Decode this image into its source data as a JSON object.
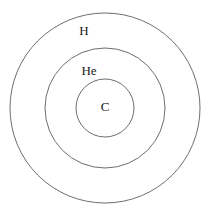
{
  "diagram": {
    "background_color": "#ffffff",
    "stroke_color": "#6e6e6e",
    "label_color": "#1a1a1a",
    "center": {
      "x": 105,
      "y": 108
    },
    "shells": [
      {
        "id": "outer",
        "label": "H",
        "radius": 95,
        "label_x": 84,
        "label_y": 30
      },
      {
        "id": "middle",
        "label": "He",
        "radius": 60,
        "label_x": 89,
        "label_y": 70
      },
      {
        "id": "inner",
        "label": "C",
        "radius": 29,
        "label_x": 105,
        "label_y": 106
      }
    ]
  }
}
